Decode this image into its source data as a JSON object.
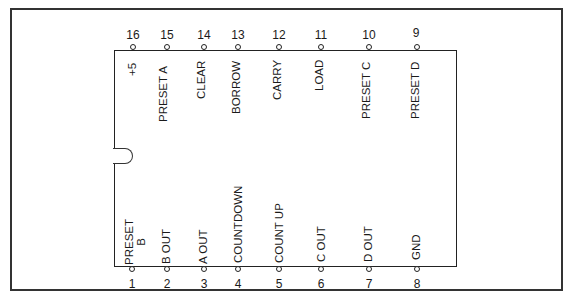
{
  "diagram": {
    "type": "ic-pinout",
    "package": "16-pin DIP",
    "top_pins": [
      {
        "number": "16",
        "label": "+5"
      },
      {
        "number": "15",
        "label": "PRESET A"
      },
      {
        "number": "14",
        "label": "CLEAR"
      },
      {
        "number": "13",
        "label": "BORROW"
      },
      {
        "number": "12",
        "label": "CARRY"
      },
      {
        "number": "11",
        "label": "LOAD"
      },
      {
        "number": "10",
        "label": "PRESET C"
      },
      {
        "number": "9",
        "label": "PRESET D"
      }
    ],
    "bottom_pins": [
      {
        "number": "1",
        "label": "PRESET",
        "label2": "B"
      },
      {
        "number": "2",
        "label": "B OUT"
      },
      {
        "number": "3",
        "label": "A OUT"
      },
      {
        "number": "4",
        "label": "COUNTDOWN"
      },
      {
        "number": "5",
        "label": "COUNT UP"
      },
      {
        "number": "6",
        "label": "C OUT"
      },
      {
        "number": "7",
        "label": "D OUT"
      },
      {
        "number": "8",
        "label": "GND"
      }
    ],
    "colors": {
      "line": "#222222",
      "background": "#ffffff"
    }
  }
}
